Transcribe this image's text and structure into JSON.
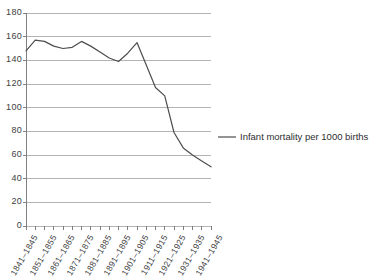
{
  "chart_data": {
    "type": "line",
    "title": "",
    "xlabel": "",
    "ylabel": "",
    "ylim": [
      0,
      180
    ],
    "ytick_step": 20,
    "grid": true,
    "legend_position": "right",
    "line_color": "#4d4d4d",
    "grid_color": "#b3b3b3",
    "axis_color": "#808080",
    "yticks": [
      "0",
      "20",
      "40",
      "60",
      "80",
      "100",
      "120",
      "140",
      "160",
      "180"
    ],
    "categories": [
      "1841–1845",
      "1846–1850",
      "1851–1855",
      "1856–1860",
      "1861–1865",
      "1866–1870",
      "1871–1875",
      "1876–1880",
      "1881–1885",
      "1886–1890",
      "1891–1895",
      "1896–1900",
      "1901–1905",
      "1906–1910",
      "1911–1915",
      "1916–1920",
      "1921–1925",
      "1926–1930",
      "1931–1935",
      "1936–1940",
      "1941–1945"
    ],
    "xtick_labels_shown": [
      "1841–1845",
      "1851–1855",
      "1861–1865",
      "1871–1875",
      "1881–1885",
      "1891–1895",
      "1901–1905",
      "1911–1915",
      "1921–1925",
      "1931–1935",
      "1941–1945"
    ],
    "series": [
      {
        "name": "Infant mortality per 1000 births",
        "values": [
          148,
          157,
          156,
          152,
          150,
          151,
          156,
          152,
          147,
          142,
          139,
          146,
          155,
          136,
          117,
          110,
          79,
          66,
          60,
          55,
          50
        ]
      }
    ]
  },
  "legend": {
    "entries": [
      {
        "label": "Infant mortality per 1000 births",
        "color": "#4d4d4d"
      }
    ]
  }
}
